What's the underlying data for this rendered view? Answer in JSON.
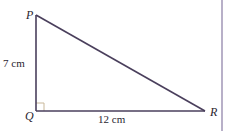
{
  "diagram": {
    "type": "right-triangle",
    "vertices": {
      "P": {
        "label": "P",
        "x": 36,
        "y": 15
      },
      "Q": {
        "label": "Q",
        "x": 36,
        "y": 111
      },
      "R": {
        "label": "R",
        "x": 205,
        "y": 111
      }
    },
    "right_angle_at": "Q",
    "sides": {
      "PQ": {
        "label": "7 cm"
      },
      "QR": {
        "label": "12 cm"
      }
    },
    "colors": {
      "line": "#4a3f5c",
      "right_angle_marker": "#c9b89a",
      "side_bar": "#b8b0c8"
    }
  }
}
